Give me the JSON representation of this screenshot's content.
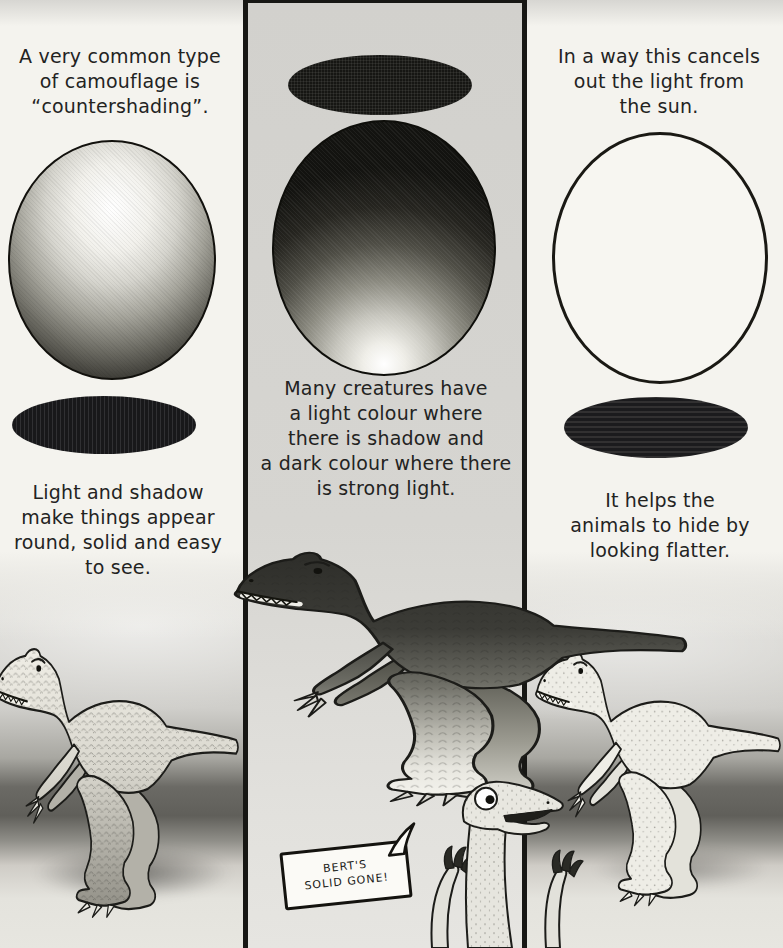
{
  "panels": {
    "left": {
      "top_lines": [
        "A very common type",
        "of camouflage is",
        "“countershading”."
      ],
      "bottom_lines": [
        "Light and shadow",
        "make things appear",
        "round, solid and easy",
        "to see."
      ]
    },
    "middle": {
      "caption_lines": [
        "Many creatures have",
        "a light colour where",
        "there is shadow and",
        "a dark colour where there",
        "is strong light."
      ]
    },
    "right": {
      "top_lines": [
        "In a way this cancels",
        "out the light from",
        "the sun."
      ],
      "bottom_lines": [
        "It helps the",
        "animals to hide by",
        "looking flatter."
      ]
    }
  },
  "speech_bubble": {
    "lines": [
      "BERT'S",
      "SOLID GONE!"
    ]
  },
  "figures": {
    "left_sphere": "sphere shaded light on top, dark below",
    "left_cast_shadow": "dark shadow ellipse below sphere",
    "middle_top_ellipse": "dark ellipse above countershaded sphere",
    "middle_sphere": "countershaded sphere, dark top and light base",
    "right_egg": "flat outlined white egg",
    "right_cast_shadow": "dark shadow ellipse below egg",
    "left_dinosaur": "normally shaded scaly theropod",
    "middle_dinosaur": "countershaded theropod, dark back and pale belly",
    "right_dinosaur": "flat outline theropod",
    "small_dinosaur": "small dinosaur peeking up with raised claws"
  },
  "colors": {
    "paper": "#f4f3ee",
    "panel_gray": "#d3d2cf",
    "ink": "#1c1c19",
    "shadow_black": "#18181a"
  }
}
